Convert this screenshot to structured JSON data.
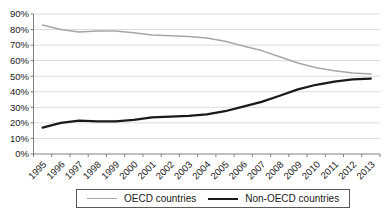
{
  "chart_data": {
    "type": "line",
    "x": [
      "1995",
      "1996",
      "1997",
      "1998",
      "1999",
      "2000",
      "2001",
      "2002",
      "2003",
      "2004",
      "2005",
      "2006",
      "2007",
      "2008",
      "2009",
      "2010",
      "2011",
      "2012",
      "2013"
    ],
    "series": [
      {
        "name": "OECD countries",
        "color": "#a6a6a6",
        "stroke_width": 1.5,
        "values": [
          83,
          80,
          78.5,
          79,
          79,
          78,
          76.5,
          76,
          75.5,
          74.5,
          72.5,
          69.5,
          66.5,
          62.5,
          58.5,
          55.5,
          53.5,
          52,
          51.5
        ]
      },
      {
        "name": "Non-OECD countries",
        "color": "#1a1a1a",
        "stroke_width": 2.2,
        "values": [
          17,
          20,
          21.5,
          21,
          21,
          22,
          23.5,
          24,
          24.5,
          25.5,
          27.5,
          30.5,
          33.5,
          37.5,
          41.5,
          44.5,
          46.5,
          48,
          48.5
        ]
      }
    ],
    "ylim": [
      0,
      90
    ],
    "ytick_step": 10,
    "ytick_labels": [
      "0%",
      "10%",
      "20%",
      "30%",
      "40%",
      "50%",
      "60%",
      "70%",
      "80%",
      "90%"
    ],
    "grid": true,
    "legend_position": "bottom",
    "xlabel": "",
    "ylabel": ""
  },
  "colors": {
    "grid": "#dcdcdc",
    "axis": "#808080",
    "tick_label": "#1a1a1a",
    "legend_border": "#595959",
    "background": "#ffffff"
  }
}
